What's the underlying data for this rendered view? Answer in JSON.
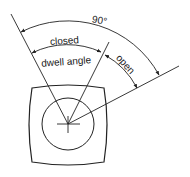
{
  "diagram": {
    "labels": {
      "total_angle": "90°",
      "closed": "closed",
      "dwell_angle": "dwell angle",
      "open": "open"
    },
    "colors": {
      "stroke": "#222222",
      "background": "#ffffff"
    }
  }
}
